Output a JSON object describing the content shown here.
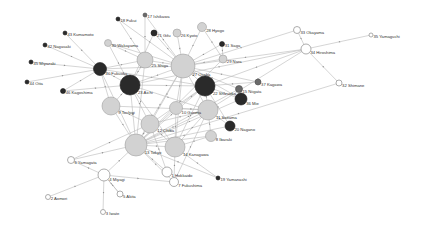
{
  "diagram": {
    "type": "directed-network",
    "colors": {
      "background": "#ffffff",
      "edge": "#b8b8b8",
      "light": "#d2d2d2",
      "white": "#ffffff",
      "dark": "#2a2a2a",
      "mid": "#6a6a6a",
      "label": "#333333"
    },
    "nodes": [
      {
        "id": "1",
        "label": "1 Hokkaido",
        "x": 167,
        "y": 172,
        "r": 5,
        "style": "white"
      },
      {
        "id": "2",
        "label": "2 Aomori",
        "x": 48,
        "y": 197,
        "r": 2.5,
        "style": "white"
      },
      {
        "id": "3",
        "label": "3 Iwate",
        "x": 103,
        "y": 212,
        "r": 2.5,
        "style": "white"
      },
      {
        "id": "4",
        "label": "4 Miyagi",
        "x": 104,
        "y": 175,
        "r": 6,
        "style": "white"
      },
      {
        "id": "5",
        "label": "5 Akita",
        "x": 120,
        "y": 194,
        "r": 3,
        "style": "white"
      },
      {
        "id": "6",
        "label": "6 Yamagata",
        "x": 71,
        "y": 160,
        "r": 3.5,
        "style": "white"
      },
      {
        "id": "7",
        "label": "7 Fukushima",
        "x": 174,
        "y": 182,
        "r": 4.5,
        "style": "white"
      },
      {
        "id": "8",
        "label": "8 Ibaraki",
        "x": 211,
        "y": 136,
        "r": 5.5,
        "style": "light"
      },
      {
        "id": "9",
        "label": "9 Tochigi",
        "x": 111,
        "y": 106,
        "r": 9,
        "style": "light"
      },
      {
        "id": "10",
        "label": "10 Gunma",
        "x": 176,
        "y": 108,
        "r": 6.5,
        "style": "light"
      },
      {
        "id": "11",
        "label": "11 Saitama",
        "x": 208,
        "y": 110,
        "r": 10,
        "style": "light"
      },
      {
        "id": "12",
        "label": "12 Chiba",
        "x": 150,
        "y": 124,
        "r": 9,
        "style": "light"
      },
      {
        "id": "13",
        "label": "13 Tokyo",
        "x": 136,
        "y": 145,
        "r": 11,
        "style": "light"
      },
      {
        "id": "14",
        "label": "14 Kanagawa",
        "x": 175,
        "y": 147,
        "r": 10,
        "style": "light"
      },
      {
        "id": "15",
        "label": "15 Niigata",
        "x": 239,
        "y": 89,
        "r": 3.5,
        "style": "mid"
      },
      {
        "id": "17",
        "label": "17 Ishikawa",
        "x": 145,
        "y": 15,
        "r": 2,
        "style": "mid"
      },
      {
        "id": "18",
        "label": "18 Fukui",
        "x": 118,
        "y": 19,
        "r": 2,
        "style": "dark"
      },
      {
        "id": "19",
        "label": "19 Yamanashi",
        "x": 218,
        "y": 178,
        "r": 2,
        "style": "dark"
      },
      {
        "id": "20",
        "label": "20 Nagano",
        "x": 230,
        "y": 126,
        "r": 5,
        "style": "dark"
      },
      {
        "id": "21",
        "label": "21 Gifu",
        "x": 154,
        "y": 33,
        "r": 3,
        "style": "dark"
      },
      {
        "id": "22",
        "label": "22 Shizuoka",
        "x": 205,
        "y": 86,
        "r": 10,
        "style": "dark"
      },
      {
        "id": "23",
        "label": "23 Aichi",
        "x": 130,
        "y": 85,
        "r": 10,
        "style": "dark"
      },
      {
        "id": "25",
        "label": "25 Shiga",
        "x": 145,
        "y": 60,
        "r": 8,
        "style": "light"
      },
      {
        "id": "26",
        "label": "26 Kyoto",
        "x": 177,
        "y": 33,
        "r": 4,
        "style": "light"
      },
      {
        "id": "27",
        "label": "27 Osaka",
        "x": 183,
        "y": 66,
        "r": 12,
        "style": "light"
      },
      {
        "id": "28",
        "label": "28 Hyogo",
        "x": 202,
        "y": 27,
        "r": 4.5,
        "style": "light"
      },
      {
        "id": "29",
        "label": "29 Nara",
        "x": 223,
        "y": 59,
        "r": 4,
        "style": "light"
      },
      {
        "id": "30",
        "label": "30 Wakayama",
        "x": 108,
        "y": 43,
        "r": 3.5,
        "style": "light"
      },
      {
        "id": "31",
        "label": "31 Saga",
        "x": 222,
        "y": 44,
        "r": 2.5,
        "style": "dark"
      },
      {
        "id": "32",
        "label": "32 Shimane",
        "x": 339,
        "y": 83,
        "r": 3,
        "style": "white"
      },
      {
        "id": "33",
        "label": "33 Okayama",
        "x": 297,
        "y": 30,
        "r": 3.5,
        "style": "white"
      },
      {
        "id": "34",
        "label": "34 Hiroshima",
        "x": 306,
        "y": 49,
        "r": 5,
        "style": "white"
      },
      {
        "id": "35",
        "label": "35 Yamaguchi",
        "x": 371,
        "y": 35,
        "r": 2,
        "style": "white"
      },
      {
        "id": "36",
        "label": "36 Mie",
        "x": 241,
        "y": 99,
        "r": 6,
        "style": "dark"
      },
      {
        "id": "37",
        "label": "37 Kagawa",
        "x": 258,
        "y": 82,
        "r": 3,
        "style": "mid"
      },
      {
        "id": "40",
        "label": "40 Fukuoka",
        "x": 100,
        "y": 69,
        "r": 6.5,
        "style": "dark"
      },
      {
        "id": "42",
        "label": "42 Nagasaki",
        "x": 45,
        "y": 45,
        "r": 2,
        "style": "dark"
      },
      {
        "id": "43",
        "label": "43 Kumamoto",
        "x": 65,
        "y": 33,
        "r": 2,
        "style": "dark"
      },
      {
        "id": "44",
        "label": "44 Oita",
        "x": 27,
        "y": 82,
        "r": 2,
        "style": "dark"
      },
      {
        "id": "45",
        "label": "45 Miyazaki",
        "x": 31,
        "y": 62,
        "r": 2,
        "style": "dark"
      },
      {
        "id": "46",
        "label": "46 Kagoshima",
        "x": 63,
        "y": 91,
        "r": 2.5,
        "style": "dark"
      }
    ],
    "edges": [
      [
        "40",
        "23"
      ],
      [
        "40",
        "27"
      ],
      [
        "40",
        "25"
      ],
      [
        "40",
        "13"
      ],
      [
        "40",
        "22"
      ],
      [
        "40",
        "9"
      ],
      [
        "42",
        "40"
      ],
      [
        "43",
        "40"
      ],
      [
        "44",
        "40"
      ],
      [
        "45",
        "40"
      ],
      [
        "46",
        "40"
      ],
      [
        "46",
        "23"
      ],
      [
        "18",
        "25"
      ],
      [
        "18",
        "27"
      ],
      [
        "17",
        "27"
      ],
      [
        "17",
        "25"
      ],
      [
        "21",
        "27"
      ],
      [
        "21",
        "23"
      ],
      [
        "26",
        "27"
      ],
      [
        "28",
        "27"
      ],
      [
        "28",
        "29"
      ],
      [
        "31",
        "29"
      ],
      [
        "31",
        "27"
      ],
      [
        "30",
        "27"
      ],
      [
        "30",
        "23"
      ],
      [
        "30",
        "25"
      ],
      [
        "33",
        "34"
      ],
      [
        "35",
        "34"
      ],
      [
        "32",
        "34"
      ],
      [
        "32",
        "13"
      ],
      [
        "34",
        "23"
      ],
      [
        "34",
        "27"
      ],
      [
        "34",
        "22"
      ],
      [
        "34",
        "11"
      ],
      [
        "33",
        "27"
      ],
      [
        "37",
        "27"
      ],
      [
        "37",
        "22"
      ],
      [
        "15",
        "13"
      ],
      [
        "15",
        "27"
      ],
      [
        "36",
        "27"
      ],
      [
        "36",
        "13"
      ],
      [
        "36",
        "22"
      ],
      [
        "25",
        "27"
      ],
      [
        "25",
        "23"
      ],
      [
        "25",
        "13"
      ],
      [
        "27",
        "13"
      ],
      [
        "27",
        "22"
      ],
      [
        "27",
        "23"
      ],
      [
        "27",
        "11"
      ],
      [
        "27",
        "12"
      ],
      [
        "27",
        "14"
      ],
      [
        "27",
        "10"
      ],
      [
        "23",
        "13"
      ],
      [
        "23",
        "22"
      ],
      [
        "23",
        "12"
      ],
      [
        "23",
        "14"
      ],
      [
        "23",
        "9"
      ],
      [
        "23",
        "11"
      ],
      [
        "22",
        "13"
      ],
      [
        "22",
        "14"
      ],
      [
        "22",
        "11"
      ],
      [
        "22",
        "12"
      ],
      [
        "22",
        "10"
      ],
      [
        "9",
        "13"
      ],
      [
        "9",
        "12"
      ],
      [
        "9",
        "11"
      ],
      [
        "10",
        "13"
      ],
      [
        "10",
        "11"
      ],
      [
        "10",
        "14"
      ],
      [
        "11",
        "13"
      ],
      [
        "11",
        "12"
      ],
      [
        "11",
        "14"
      ],
      [
        "12",
        "13"
      ],
      [
        "12",
        "14"
      ],
      [
        "14",
        "13"
      ],
      [
        "8",
        "13"
      ],
      [
        "8",
        "11"
      ],
      [
        "8",
        "14"
      ],
      [
        "20",
        "13"
      ],
      [
        "20",
        "11"
      ],
      [
        "20",
        "22"
      ],
      [
        "19",
        "14"
      ],
      [
        "19",
        "13"
      ],
      [
        "1",
        "13"
      ],
      [
        "1",
        "12"
      ],
      [
        "7",
        "13"
      ],
      [
        "7",
        "14"
      ],
      [
        "7",
        "11"
      ],
      [
        "4",
        "13"
      ],
      [
        "4",
        "6"
      ],
      [
        "4",
        "7"
      ],
      [
        "4",
        "5"
      ],
      [
        "4",
        "3"
      ],
      [
        "2",
        "4"
      ],
      [
        "6",
        "13"
      ],
      [
        "6",
        "12"
      ],
      [
        "5",
        "4"
      ],
      [
        "29",
        "27"
      ],
      [
        "29",
        "13"
      ]
    ]
  }
}
